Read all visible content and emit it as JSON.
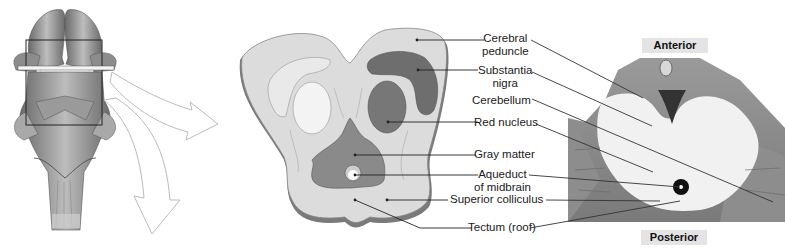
{
  "figure": {
    "orientation": {
      "top": "Anterior",
      "bottom": "Posterior"
    },
    "labels": [
      {
        "id": "cerebral-peduncle",
        "line1": "Cerebral",
        "line2": "peduncle"
      },
      {
        "id": "substantia-nigra",
        "line1": "Substantia",
        "line2": "nigra"
      },
      {
        "id": "cerebellum",
        "line1": "Cerebellum",
        "line2": ""
      },
      {
        "id": "red-nucleus",
        "line1": "Red nucleus",
        "line2": ""
      },
      {
        "id": "gray-matter",
        "line1": "Gray matter",
        "line2": ""
      },
      {
        "id": "aqueduct-of-midbrain",
        "line1": "Aqueduct",
        "line2": "of midbrain"
      },
      {
        "id": "superior-colliculus",
        "line1": "Superior colliculus",
        "line2": ""
      },
      {
        "id": "tectum",
        "line1": "Tectum (roof)",
        "line2": ""
      }
    ],
    "colors": {
      "peduncle_fill": "#dcdcdc",
      "nigra_fill": "#6e6e6e",
      "red_nucleus_fill": "#777777",
      "gray_matter_fill": "#8a8a8a",
      "outline": "#7a7a7a",
      "leader_line": "#222222",
      "orient_bg": "#e4e4e4"
    }
  }
}
